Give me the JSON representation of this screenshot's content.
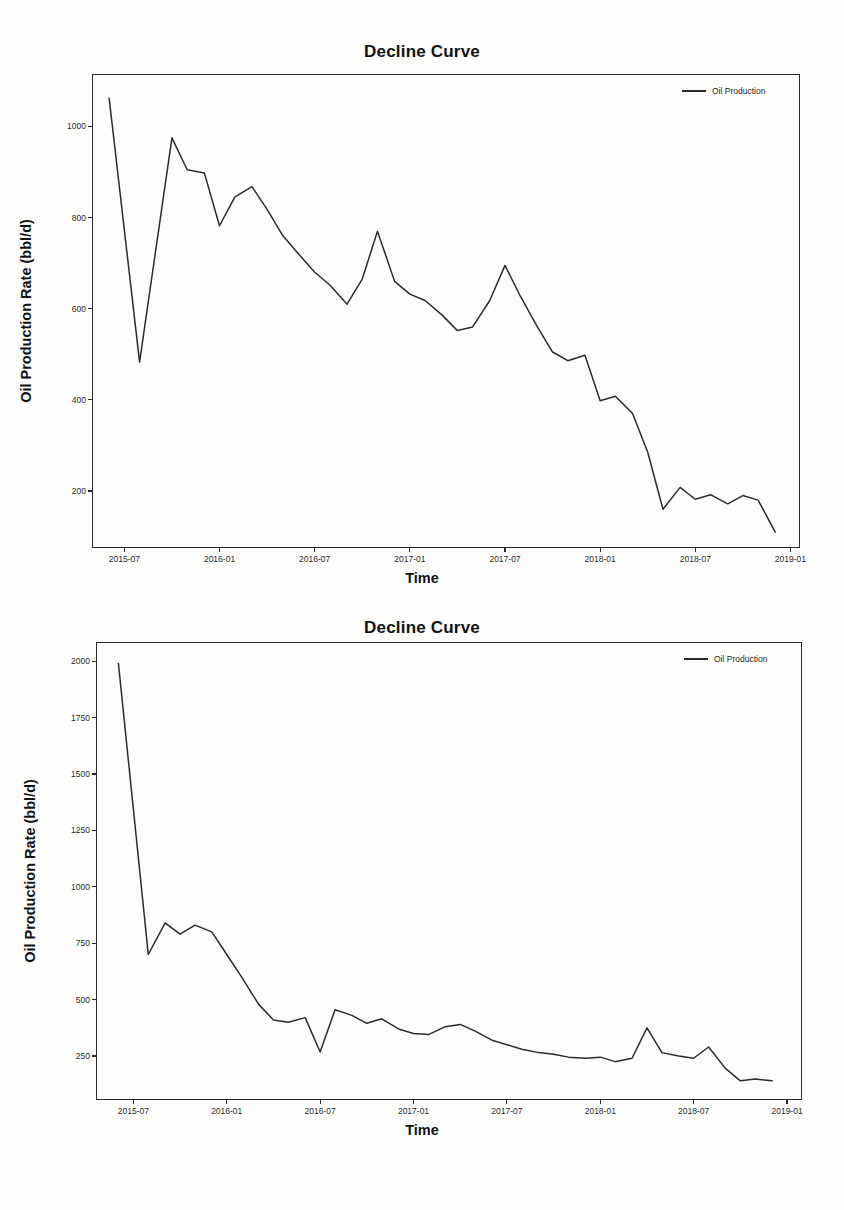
{
  "figures": [
    {
      "id": "top",
      "title": "Decline Curve",
      "legend_label": "Oil Production",
      "xlabel": "Time",
      "ylabel": "Oil Production Rate (bbl/d)"
    },
    {
      "id": "bottom",
      "title": "Decline Curve",
      "legend_label": "Oil Production",
      "xlabel": "Time",
      "ylabel": "Oil Production Rate (bbl/d)"
    }
  ],
  "chart_data": [
    {
      "type": "line",
      "title": "Decline Curve",
      "xlabel": "Time",
      "ylabel": "Oil Production Rate (bbl/d)",
      "legend": [
        "Oil Production"
      ],
      "legend_position": "top-right",
      "grid": false,
      "line_color": "#2b2b2b",
      "xtick_labels": [
        "2015-07",
        "2016-01",
        "2016-07",
        "2017-01",
        "2017-07",
        "2018-01",
        "2018-07",
        "2019-01"
      ],
      "xtick_values": [
        2015.5,
        2016.0,
        2016.5,
        2017.0,
        2017.5,
        2018.0,
        2018.5,
        2019.0
      ],
      "ytick_labels": [
        "200",
        "400",
        "600",
        "800",
        "1000"
      ],
      "ytick_values": [
        200,
        400,
        600,
        800,
        1000
      ],
      "xlim": [
        2015.33,
        2019.05
      ],
      "ylim": [
        75,
        1115
      ],
      "x": [
        2015.42,
        2015.58,
        2015.75,
        2015.83,
        2015.92,
        2016.0,
        2016.08,
        2016.17,
        2016.25,
        2016.33,
        2016.42,
        2016.5,
        2016.58,
        2016.67,
        2016.75,
        2016.83,
        2016.92,
        2017.0,
        2017.08,
        2017.17,
        2017.25,
        2017.33,
        2017.42,
        2017.5,
        2017.58,
        2017.67,
        2017.75,
        2017.83,
        2017.92,
        2018.0,
        2018.08,
        2018.17,
        2018.25,
        2018.33,
        2018.42,
        2018.5,
        2018.58,
        2018.67,
        2018.75,
        2018.83,
        2018.92
      ],
      "values": [
        1062,
        483,
        975,
        905,
        898,
        782,
        845,
        868,
        818,
        762,
        718,
        680,
        652,
        610,
        665,
        770,
        660,
        632,
        618,
        586,
        552,
        560,
        618,
        695,
        628,
        560,
        505,
        486,
        498,
        398,
        408,
        370,
        285,
        160,
        208,
        182,
        192,
        172,
        190,
        180,
        110
      ],
      "annotations": []
    },
    {
      "type": "line",
      "title": "Decline Curve",
      "xlabel": "Time",
      "ylabel": "Oil Production Rate (bbl/d)",
      "legend": [
        "Oil Production"
      ],
      "legend_position": "top-right",
      "grid": false,
      "line_color": "#2b2b2b",
      "xtick_labels": [
        "2015-07",
        "2016-01",
        "2016-07",
        "2017-01",
        "2017-07",
        "2018-01",
        "2018-07",
        "2019-01"
      ],
      "xtick_values": [
        2015.5,
        2016.0,
        2016.5,
        2017.0,
        2017.5,
        2018.0,
        2018.5,
        2019.0
      ],
      "ytick_labels": [
        "250",
        "500",
        "750",
        "1000",
        "1250",
        "1500",
        "1750",
        "2000"
      ],
      "ytick_values": [
        250,
        500,
        750,
        1000,
        1250,
        1500,
        1750,
        2000
      ],
      "xlim": [
        2015.3,
        2019.08
      ],
      "ylim": [
        55,
        2085
      ],
      "x": [
        2015.42,
        2015.58,
        2015.67,
        2015.75,
        2015.83,
        2015.92,
        2016.0,
        2016.08,
        2016.17,
        2016.25,
        2016.33,
        2016.42,
        2016.5,
        2016.58,
        2016.67,
        2016.75,
        2016.83,
        2016.92,
        2017.0,
        2017.08,
        2017.17,
        2017.25,
        2017.33,
        2017.42,
        2017.5,
        2017.58,
        2017.67,
        2017.75,
        2017.83,
        2017.92,
        2018.0,
        2018.08,
        2018.17,
        2018.25,
        2018.33,
        2018.42,
        2018.5,
        2018.58,
        2018.67,
        2018.75,
        2018.83,
        2018.92
      ],
      "values": [
        1990,
        700,
        840,
        790,
        830,
        800,
        700,
        600,
        480,
        410,
        400,
        420,
        268,
        455,
        430,
        395,
        415,
        370,
        350,
        345,
        380,
        390,
        360,
        320,
        300,
        280,
        265,
        258,
        245,
        240,
        245,
        225,
        240,
        375,
        265,
        250,
        240,
        290,
        195,
        140,
        148,
        140,
        120,
        138,
        125
      ],
      "annotations": []
    }
  ]
}
